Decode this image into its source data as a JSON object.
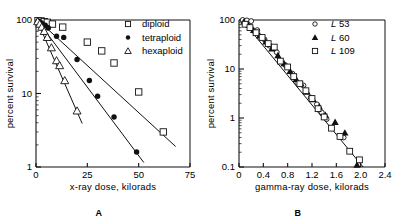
{
  "figure": {
    "panels": [
      {
        "id": "A",
        "caption": "A",
        "xlabel": "x-ray dose, kilorads",
        "ylabel": "percent survival",
        "xticks": [
          "0",
          "25",
          "50",
          "75"
        ],
        "yticks": [
          "100",
          "10",
          "1"
        ],
        "legend": [
          {
            "marker": "open-square",
            "label": "diploid"
          },
          {
            "marker": "filled-circle",
            "label": "tetraploid"
          },
          {
            "marker": "open-triangle",
            "label": "hexaploid"
          }
        ]
      },
      {
        "id": "B",
        "caption": "B",
        "xlabel": "gamma-ray dose, kilorads",
        "ylabel": "percent survival",
        "xticks": [
          "0",
          "0.4",
          "0.8",
          "1.2",
          "1.6",
          "2.0",
          "2.4"
        ],
        "yticks": [
          "100",
          "10",
          "1",
          "0.1"
        ],
        "legend": [
          {
            "marker": "open-circle",
            "label_italic": "L",
            "label": "53"
          },
          {
            "marker": "filled-triangle",
            "label_italic": "L",
            "label": "60"
          },
          {
            "marker": "open-square",
            "label_italic": "L",
            "label": "109"
          }
        ]
      }
    ]
  },
  "chart_data": [
    {
      "type": "scatter",
      "panel": "A",
      "title": "",
      "xlabel": "x-ray dose, kilorads",
      "ylabel": "percent survival",
      "xlim": [
        0,
        75
      ],
      "ylim": [
        1,
        100
      ],
      "yscale": "log",
      "xticks": [
        0,
        25,
        50,
        75
      ],
      "yticks": [
        100,
        10,
        1
      ],
      "grid": false,
      "legend_position": "top-right",
      "series": [
        {
          "name": "diploid",
          "marker": "open-square",
          "points": [
            [
              1.0,
              98
            ],
            [
              2.5,
              97
            ],
            [
              4.0,
              95
            ],
            [
              5.5,
              93
            ],
            [
              8.0,
              88
            ],
            [
              13.0,
              80
            ],
            [
              25.0,
              50
            ],
            [
              32.0,
              38
            ],
            [
              38.0,
              26
            ],
            [
              50.0,
              10.5
            ],
            [
              62.0,
              3.0
            ]
          ],
          "fit_line": [
            [
              1.0,
              99
            ],
            [
              68.0,
              1.9
            ]
          ]
        },
        {
          "name": "tetraploid",
          "marker": "filled-circle",
          "points": [
            [
              1.0,
              97
            ],
            [
              2.0,
              94
            ],
            [
              3.0,
              90
            ],
            [
              4.5,
              85
            ],
            [
              6.0,
              78
            ],
            [
              10.0,
              60
            ],
            [
              13.5,
              58
            ],
            [
              20.0,
              29
            ],
            [
              26.0,
              15
            ],
            [
              30.0,
              9.2
            ],
            [
              38.0,
              4.8
            ],
            [
              49.0,
              1.6
            ]
          ],
          "fit_line": [
            [
              0.5,
              100
            ],
            [
              52.5,
              1.15
            ]
          ]
        },
        {
          "name": "hexaploid",
          "marker": "open-triangle",
          "points": [
            [
              0.8,
              95
            ],
            [
              1.8,
              88
            ],
            [
              2.8,
              80
            ],
            [
              4.0,
              70
            ],
            [
              5.5,
              58
            ],
            [
              7.5,
              42
            ],
            [
              10.0,
              28
            ],
            [
              11.5,
              24
            ],
            [
              14.0,
              15
            ],
            [
              20.0,
              5.8
            ]
          ],
          "fit_line": [
            [
              0.5,
              99
            ],
            [
              22.5,
              3.9
            ]
          ]
        }
      ]
    },
    {
      "type": "scatter",
      "panel": "B",
      "title": "",
      "xlabel": "gamma-ray dose, kilorads",
      "ylabel": "percent survival",
      "xlim": [
        0,
        2.4
      ],
      "ylim": [
        0.1,
        100
      ],
      "yscale": "log",
      "xticks": [
        0,
        0.4,
        0.8,
        1.2,
        1.6,
        2.0,
        2.4
      ],
      "yticks": [
        100,
        10,
        1,
        0.1
      ],
      "grid": false,
      "legend_position": "top-right",
      "series": [
        {
          "name": "L 53",
          "marker": "open-circle",
          "points": [
            [
              0.06,
              100
            ],
            [
              0.13,
              98
            ],
            [
              0.2,
              95
            ],
            [
              0.3,
              62
            ],
            [
              0.42,
              40
            ],
            [
              0.5,
              30
            ],
            [
              0.62,
              22
            ],
            [
              0.76,
              12
            ],
            [
              0.88,
              8.0
            ],
            [
              0.96,
              5.2
            ],
            [
              1.06,
              4.6
            ],
            [
              1.18,
              2.6
            ],
            [
              1.28,
              1.9
            ],
            [
              1.36,
              1.3
            ],
            [
              1.44,
              0.95
            ],
            [
              1.72,
              0.4
            ]
          ]
        },
        {
          "name": "L 60",
          "marker": "filled-triangle",
          "points": [
            [
              0.08,
              92
            ],
            [
              0.16,
              78
            ],
            [
              0.24,
              62
            ],
            [
              0.34,
              48
            ],
            [
              0.44,
              36
            ],
            [
              0.54,
              26
            ],
            [
              0.64,
              19
            ],
            [
              0.74,
              13
            ],
            [
              0.84,
              9.0
            ],
            [
              0.94,
              6.2
            ],
            [
              1.02,
              5.0
            ],
            [
              1.12,
              3.4
            ],
            [
              1.22,
              2.4
            ],
            [
              1.32,
              1.7
            ],
            [
              1.42,
              1.15
            ],
            [
              1.58,
              0.82
            ],
            [
              1.74,
              0.5
            ],
            [
              1.94,
              0.11
            ]
          ]
        },
        {
          "name": "L 109",
          "marker": "open-square",
          "points": [
            [
              0.1,
              82
            ],
            [
              0.18,
              70
            ],
            [
              0.28,
              55
            ],
            [
              0.38,
              44
            ],
            [
              0.48,
              33
            ],
            [
              0.58,
              28
            ],
            [
              0.68,
              14.5
            ],
            [
              0.8,
              11
            ],
            [
              0.9,
              7.0
            ],
            [
              1.0,
              5.0
            ],
            [
              1.1,
              3.6
            ],
            [
              1.2,
              2.5
            ],
            [
              1.3,
              1.55
            ],
            [
              1.4,
              1.05
            ],
            [
              1.52,
              0.62
            ],
            [
              1.66,
              0.42
            ],
            [
              1.82,
              0.21
            ],
            [
              1.98,
              0.14
            ]
          ]
        }
      ],
      "fit_line": [
        [
          0.05,
          100
        ],
        [
          2.04,
          0.1
        ]
      ]
    }
  ]
}
